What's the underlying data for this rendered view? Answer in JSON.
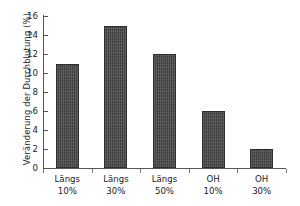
{
  "chart_data": {
    "type": "bar",
    "title": "",
    "subtitle": "",
    "xlabel": "",
    "ylabel": "Veränderung der Durchblutung (%)",
    "categories": [
      "Längs 10%",
      "Längs 30%",
      "Längs 50%",
      "OH 10%",
      "OH 30%"
    ],
    "category_lines": [
      {
        "line1": "Längs",
        "line2": "10%"
      },
      {
        "line1": "Längs",
        "line2": "30%"
      },
      {
        "line1": "Längs",
        "line2": "50%"
      },
      {
        "line1": "OH",
        "line2": "10%"
      },
      {
        "line1": "OH",
        "line2": "30%"
      }
    ],
    "values": [
      11,
      15,
      12,
      6,
      2
    ],
    "ylim": [
      0,
      16
    ],
    "y_ticks": [
      0,
      2,
      4,
      6,
      8,
      10,
      12,
      14,
      16
    ],
    "y_tick_labels": [
      "0",
      "2",
      "4",
      "6",
      "8",
      "10",
      "12",
      "14",
      "16"
    ],
    "grid": false,
    "legend": null,
    "legend_position": "none",
    "bar_color": "#4a4a4a",
    "bar_edge_color": "#2e2e2e",
    "axis_color": "#555555",
    "background_color": "#ffffff",
    "series": [
      {
        "name": "Veränderung der Durchblutung",
        "values": [
          11,
          15,
          12,
          6,
          2
        ]
      }
    ],
    "annotations": []
  }
}
